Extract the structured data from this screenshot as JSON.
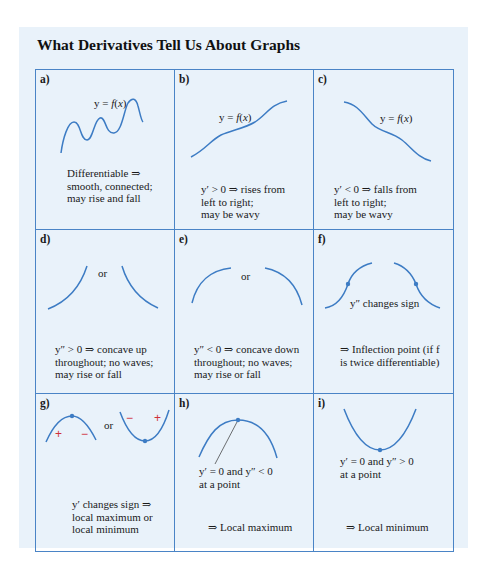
{
  "title": "What Derivatives Tell Us About Graphs",
  "colors": {
    "panel_bg": "#e9f2fa",
    "grid_line": "#4a84c6",
    "curve": "#3d7cc4",
    "sign_marks": "#d0303a"
  },
  "cells": [
    {
      "label": "a)",
      "graph_label": "y = f(x)",
      "caption": [
        "Differentiable ⇒",
        "smooth, connected;",
        "may rise and fall"
      ]
    },
    {
      "label": "b)",
      "graph_label": "y = f(x)",
      "caption": [
        "y′ > 0 ⇒ rises from",
        "left to right;",
        "may be wavy"
      ]
    },
    {
      "label": "c)",
      "graph_label": "y = f(x)",
      "caption": [
        "y′ < 0 ⇒ falls from",
        "left to right;",
        "may be wavy"
      ]
    },
    {
      "label": "d)",
      "graph_label": "or",
      "caption": [
        "y″ > 0 ⇒ concave up",
        "throughout; no waves;",
        "may rise or fall"
      ]
    },
    {
      "label": "e)",
      "graph_label": "or",
      "caption": [
        "y″ < 0 ⇒ concave down",
        "throughout; no waves;",
        "may rise or fall"
      ]
    },
    {
      "label": "f)",
      "graph_label": "y″ changes sign",
      "caption": [
        "⇒ Inflection point (if f",
        "is twice differentiable)"
      ]
    },
    {
      "label": "g)",
      "graph_label": "or",
      "signs": [
        "+",
        "−",
        "−",
        "+"
      ],
      "caption": [
        "y′ changes sign ⇒",
        "local maximum or",
        "local minimum"
      ]
    },
    {
      "label": "h)",
      "graph_label": [
        "y′ = 0  and  y″ < 0",
        "at a point"
      ],
      "caption": [
        "⇒ Local maximum"
      ]
    },
    {
      "label": "i)",
      "graph_label": [
        "y′ = 0  and  y″ > 0",
        "at a point"
      ],
      "caption": [
        "⇒ Local minimum"
      ]
    }
  ]
}
